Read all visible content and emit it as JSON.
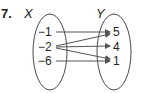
{
  "problem_number": "7.",
  "domain_set": {
    "label": "X",
    "elements": [
      "−1",
      "−2",
      "−6"
    ]
  },
  "range_set": {
    "label": "Y",
    "elements": [
      "5",
      "4",
      "1"
    ]
  },
  "mappings": [
    {
      "from": "−1",
      "to": "5"
    },
    {
      "from": "−2",
      "to": "5"
    },
    {
      "from": "−2",
      "to": "4"
    },
    {
      "from": "−2",
      "to": "1"
    },
    {
      "from": "−6",
      "to": "1"
    }
  ],
  "colors": {
    "ink": "#222222",
    "arrow": "#555555"
  }
}
